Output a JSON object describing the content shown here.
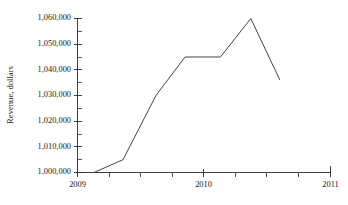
{
  "chart_data": {
    "type": "line",
    "title": "",
    "xlabel": "",
    "ylabel": "Revenue, dollars",
    "xlim": [
      2009,
      2011
    ],
    "ylim": [
      1000000,
      1060000
    ],
    "grid": false,
    "legend": null,
    "x_tick_labels": [
      "2009",
      "2010",
      "2011"
    ],
    "x_tick_values": [
      2009,
      2010,
      2011
    ],
    "x_minor_tick_count_per_interval": 4,
    "y_tick_labels": [
      "1,000,000",
      "1,010,000",
      "1,020,000",
      "1,030,000",
      "1,040,000",
      "1,050,000",
      "1,060,000"
    ],
    "y_tick_values": [
      1000000,
      1010000,
      1020000,
      1030000,
      1040000,
      1050000,
      1060000
    ],
    "y_minor_step": 5000,
    "series": [
      {
        "name": "Revenue",
        "color": "#3a3a3a",
        "x": [
          2009.13,
          2009.36,
          2009.62,
          2009.85,
          2010.13,
          2010.37,
          2010.6
        ],
        "y": [
          1000000,
          1005000,
          1030000,
          1045000,
          1045000,
          1060000,
          1036000
        ]
      }
    ]
  },
  "axis_labels": {
    "y_title": "Revenue, dollars",
    "x_2009": "2009",
    "x_2010": "2010",
    "x_2011": "2011",
    "y_1000000": "1,000,000",
    "y_1010000": "1,010,000",
    "y_1020000": "1,020,000",
    "y_1030000": "1,030,000",
    "y_1040000": "1,040,000",
    "y_1050000": "1,050,000",
    "y_1060000": "1,060,000"
  },
  "colors": {
    "line": "#3a3a3a",
    "axis": "#2b2b2b",
    "background": "#ffffff",
    "text": "#1a1a1a"
  }
}
